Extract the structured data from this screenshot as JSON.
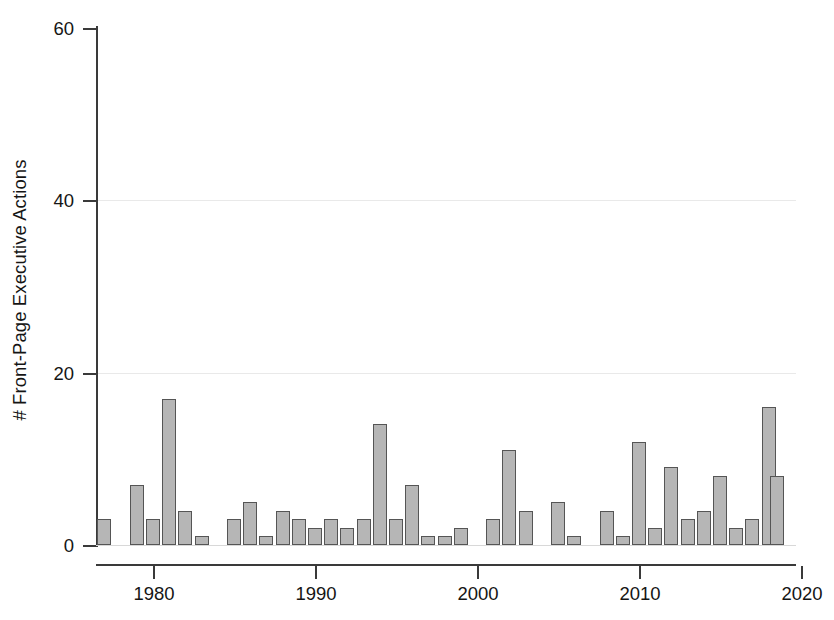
{
  "figure": {
    "background": "#ffffff",
    "bar_fill": "#b6b6b6",
    "bar_stroke": "#555555",
    "axis_color": "#3a3a3a",
    "grid_color": "#e9e9e9"
  },
  "chart_data": {
    "type": "bar",
    "title": "",
    "subtitle": "",
    "xlabel": "",
    "ylabel": "# Front-Page Executive Actions",
    "xlim": [
      1976,
      2020
    ],
    "ylim": [
      0,
      62
    ],
    "yticks": [
      0,
      20,
      40,
      60
    ],
    "ytick_labels": [
      "0",
      "20",
      "40",
      "60"
    ],
    "xticks": [
      1980,
      1990,
      2000,
      2010,
      2020
    ],
    "xtick_labels": [
      "1980",
      "1990",
      "2000",
      "2010",
      "2020"
    ],
    "grid": "horizontal-only",
    "legend": "none",
    "legend_position": "none",
    "categories": [
      1977,
      1978,
      1979,
      1980,
      1981,
      1982,
      1983,
      1984,
      1985,
      1986,
      1987,
      1988,
      1989,
      1990,
      1991,
      1992,
      1993,
      1994,
      1995,
      1996,
      1997,
      1998,
      1999,
      2000,
      2001,
      2002,
      2003,
      2004,
      2005,
      2006,
      2007,
      2008,
      2009,
      2010,
      2011,
      2012,
      2013,
      2014,
      2015,
      2016,
      2017,
      2018
    ],
    "values": [
      3,
      0,
      7,
      3,
      17,
      4,
      1,
      0,
      3,
      5,
      1,
      4,
      3,
      2,
      3,
      2,
      3,
      14,
      3,
      7,
      1,
      1,
      2,
      0,
      3,
      11,
      4,
      0,
      5,
      1,
      0,
      4,
      1,
      12,
      2,
      9,
      3,
      4,
      8,
      2,
      3,
      16
    ],
    "extra_bars": [
      {
        "year": 2018.5,
        "value": 8
      }
    ]
  }
}
